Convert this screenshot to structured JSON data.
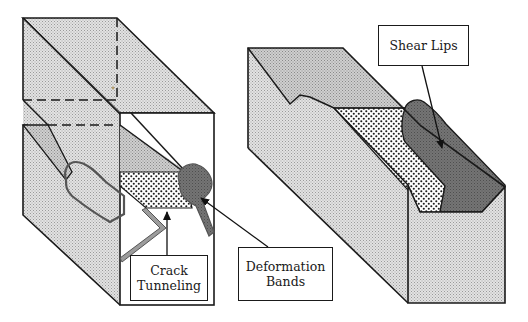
{
  "figure": {
    "colors": {
      "stipple_light": "#d8d8d8",
      "stipple_mid": "#c4c4c4",
      "shear_lip": "#6e6e6e",
      "fracture_surface_dots": "#1e1e1e",
      "outline": "#1a1a1a",
      "background": "#ffffff"
    }
  },
  "labels": {
    "crack_tunneling": {
      "line1": "Crack",
      "line2": "Tunneling"
    },
    "deformation_bands": {
      "line1": "Deformation",
      "line2": "Bands"
    },
    "shear_lips": {
      "line1": "Shear Lips"
    }
  }
}
